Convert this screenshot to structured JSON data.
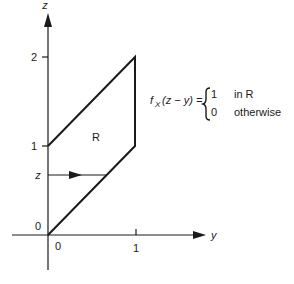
{
  "diagram": {
    "axes": {
      "vertical_label": "z",
      "horizontal_label": "y",
      "vertical_ticks": [
        {
          "value": "2",
          "label": "2"
        },
        {
          "value": "1",
          "label": "1"
        },
        {
          "value": "0",
          "label": "0"
        }
      ],
      "horizontal_ticks": [
        {
          "value": "0",
          "label": "0"
        },
        {
          "value": "1",
          "label": "1"
        }
      ]
    },
    "region": {
      "label": "R",
      "vertices": [
        [
          0,
          0
        ],
        [
          0,
          1
        ],
        [
          1,
          2
        ],
        [
          1,
          1
        ]
      ]
    },
    "level_marker": {
      "label": "z"
    },
    "formula": {
      "lhs_f": "f",
      "lhs_sub": "X",
      "lhs_arg": "(z − y) =",
      "case1_value": "1",
      "case1_condition": "in R",
      "case2_value": "0",
      "case2_condition": "otherwise"
    }
  },
  "colors": {
    "stroke": "#1a1a1a",
    "background": "#ffffff"
  }
}
